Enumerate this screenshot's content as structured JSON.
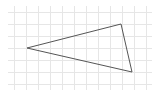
{
  "diagram": {
    "type": "triangle-on-grid",
    "background": "#ffffff",
    "grid": {
      "color": "#e6e6e6",
      "spacing": 12,
      "x_lines": [
        14,
        26,
        38,
        50,
        62,
        74,
        86,
        98,
        110,
        122,
        134,
        146
      ],
      "y_lines": [
        12,
        24,
        36,
        48,
        60,
        72,
        84
      ],
      "x_extent": [
        8,
        152
      ],
      "y_extent": [
        6,
        90
      ]
    },
    "triangle": {
      "stroke": "#555555",
      "stroke_width": 1,
      "fill": "none",
      "vertices": [
        {
          "name": "A",
          "x": 27,
          "y": 48
        },
        {
          "name": "B",
          "x": 121,
          "y": 24
        },
        {
          "name": "C",
          "x": 132,
          "y": 72
        }
      ]
    }
  }
}
